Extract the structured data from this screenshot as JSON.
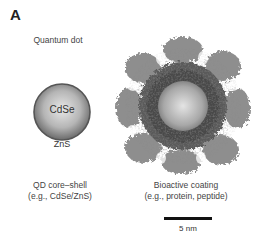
{
  "figure": {
    "panel_label": "A",
    "title": "Quantum dot",
    "core_shell": {
      "core_label": "CdSe",
      "shell_label": "ZnS",
      "caption_line1": "QD core–shell",
      "caption_line2": "(e.g., CdSe/ZnS)"
    },
    "coated": {
      "caption_line1": "Bioactive coating",
      "caption_line2": "(e.g., protein, peptide)"
    },
    "scale_bar": {
      "label": "5 nm"
    }
  },
  "colors": {
    "sphere_light": "#e8e8e8",
    "sphere_dark": "#6a6a6a",
    "coating_dark": "#4a4a4a",
    "coating_light": "#9a9a9a"
  }
}
